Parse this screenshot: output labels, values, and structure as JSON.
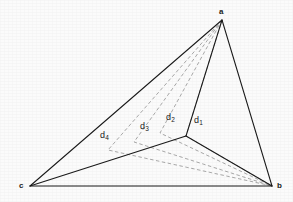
{
  "figure": {
    "kind": "geometric-diagram",
    "background_color": "#fbfbfb",
    "solid_line_color": "#1a1a1a",
    "dashed_line_color": "#9a9a9a",
    "canvas": {
      "width": 293,
      "height": 202
    }
  },
  "vertices": [
    {
      "id": "a",
      "label": "a",
      "x": 222,
      "y": 20,
      "label_x": 219,
      "label_y": 8
    },
    {
      "id": "b",
      "label": "b",
      "x": 272,
      "y": 186,
      "label_x": 277,
      "label_y": 182
    },
    {
      "id": "c",
      "label": "c",
      "x": 30,
      "y": 186,
      "label_x": 19,
      "label_y": 182
    },
    {
      "id": "j",
      "label": "",
      "x": 186,
      "y": 136,
      "label_x": 0,
      "label_y": 0
    }
  ],
  "solid_edges": [
    {
      "name": "edge-a-c",
      "from": "a",
      "to": "c"
    },
    {
      "name": "edge-a-b",
      "from": "a",
      "to": "b"
    },
    {
      "name": "edge-c-b",
      "from": "c",
      "to": "b"
    },
    {
      "name": "edge-a-j",
      "from": "a",
      "to": "j"
    },
    {
      "name": "edge-c-j",
      "from": "c",
      "to": "j"
    },
    {
      "name": "edge-j-b",
      "from": "j",
      "to": "b"
    }
  ],
  "dashed_paths": [
    {
      "id": "d1",
      "label": "d",
      "subscript": "1",
      "label_x": 194,
      "label_y": 116,
      "bend_x": 186,
      "bend_y": 136,
      "from": "a",
      "to": "b",
      "note": "innermost path; coincides with the solid junction elbow"
    },
    {
      "id": "d2",
      "label": "d",
      "subscript": "2",
      "label_x": 166,
      "label_y": 113,
      "bend_x": 160,
      "bend_y": 133,
      "from": "a",
      "to": "b"
    },
    {
      "id": "d3",
      "label": "d",
      "subscript": "3",
      "label_x": 140,
      "label_y": 122,
      "bend_x": 134,
      "bend_y": 142,
      "from": "a",
      "to": "b"
    },
    {
      "id": "d4",
      "label": "d",
      "subscript": "4",
      "label_x": 100,
      "label_y": 131,
      "bend_x": 108,
      "bend_y": 150,
      "from": "a",
      "to": "b"
    }
  ]
}
